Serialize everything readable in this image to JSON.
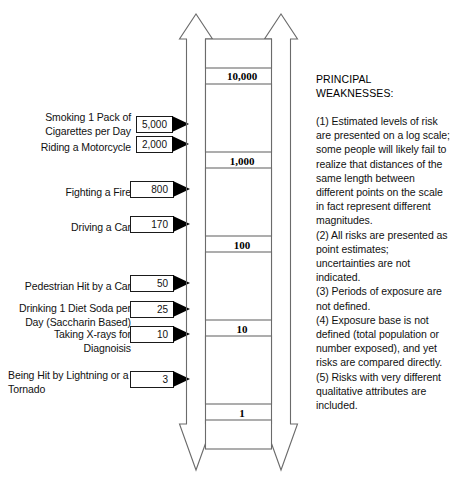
{
  "figure": {
    "type": "risk-ladder-diagram",
    "scale_type": "logarithmic"
  },
  "scale": {
    "ticks": [
      {
        "label": "10,000",
        "top": 70
      },
      {
        "label": "1,000",
        "top": 155
      },
      {
        "label": "100",
        "top": 239
      },
      {
        "label": "10",
        "top": 323
      },
      {
        "label": "1",
        "top": 407
      }
    ]
  },
  "risks": [
    {
      "label": "Smoking 1 Pack of Cigarettes per Day",
      "value": "5,000",
      "label_align": "right",
      "label_top": 111,
      "row_top": 116,
      "box_left": 136,
      "box_width": 37,
      "arrow_left": 172
    },
    {
      "label": "Riding a Motorcycle",
      "value": "2,000",
      "label_align": "right",
      "label_top": 141,
      "row_top": 136,
      "box_left": 136,
      "box_width": 37,
      "arrow_left": 172
    },
    {
      "label": "Fighting a Fire",
      "value": "800",
      "label_align": "right",
      "label_top": 186,
      "row_top": 181,
      "box_left": 130,
      "box_width": 44,
      "arrow_left": 173
    },
    {
      "label": "Driving a Car",
      "value": "170",
      "label_align": "right",
      "label_top": 221,
      "row_top": 216,
      "box_left": 130,
      "box_width": 44,
      "arrow_left": 173
    },
    {
      "label": "Pedestrian Hit by a Car",
      "value": "50",
      "label_align": "right",
      "label_top": 280,
      "row_top": 275,
      "box_left": 130,
      "box_width": 44,
      "arrow_left": 173
    },
    {
      "label": "Drinking 1 Diet Soda per Day (Saccharin Based)",
      "value": "25",
      "label_align": "right",
      "label_top": 302,
      "row_top": 301,
      "box_left": 130,
      "box_width": 44,
      "arrow_left": 173
    },
    {
      "label": "Taking X-rays for Diagnoisis",
      "value": "10",
      "label_align": "right",
      "label_top": 328,
      "row_top": 326,
      "box_left": 130,
      "box_width": 44,
      "arrow_left": 173
    },
    {
      "label": "Being Hit by Lightning or a Tornado",
      "value": "3",
      "label_align": "left",
      "label_top": 369,
      "row_top": 371,
      "box_left": 130,
      "box_width": 44,
      "arrow_left": 173
    }
  ],
  "notes": {
    "title": "PRINCIPAL WEAKNESSES:",
    "items": [
      "(1) Estimated levels of risk are presented on a log scale; some people will likely fail to realize that distances of the same length between different points on the scale in fact represent different magnitudes.",
      "(2) All risks are presented as point estimates; uncertainties are not indicated.",
      "(3) Periods of exposure are not defined.",
      "(4) Exposure base is not defined (total population or number exposed), and yet risks are compared directly.",
      "(5) Risks with very different qualitative attributes are included."
    ]
  },
  "colors": {
    "ink": "#000000",
    "line": "#6b6b6b",
    "background": "#ffffff"
  }
}
